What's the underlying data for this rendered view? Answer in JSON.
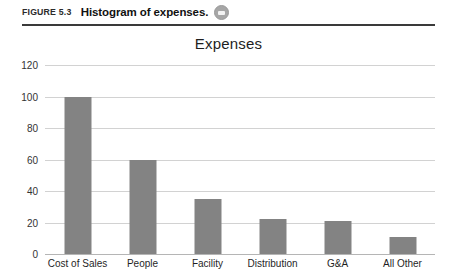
{
  "figure": {
    "number": "FIGURE 5.3",
    "caption": "Histogram of expenses.",
    "icon": "media-disc-icon"
  },
  "chart_data": {
    "type": "bar",
    "title": "Expenses",
    "xlabel": "",
    "ylabel": "",
    "categories": [
      "Cost of Sales",
      "People",
      "Facility",
      "Distribution",
      "G&A",
      "All Other"
    ],
    "values": [
      100,
      60,
      35,
      22,
      21,
      11
    ],
    "yticks": [
      "0",
      "20",
      "40",
      "60",
      "80",
      "100",
      "120"
    ],
    "ylim": [
      0,
      120
    ],
    "grid": true,
    "legend": false,
    "bar_color": "#838383",
    "gridline_color": "#d2d2d2"
  }
}
